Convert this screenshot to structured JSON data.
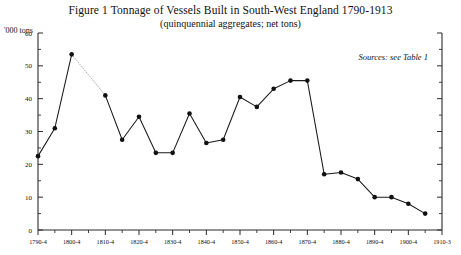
{
  "figure": {
    "title": "Figure 1   Tonnage of Vessels Built in South-West England 1790-1913",
    "subtitle": "(quinquennial aggregates; net tons)",
    "y_axis_unit": "'000 tons",
    "sources_note": "Sources: see Table 1"
  },
  "chart_data": {
    "type": "line",
    "title": "Figure 1   Tonnage of Vessels Built in South-West England 1790-1913",
    "subtitle": "(quinquennial aggregates; net tons)",
    "xlabel": "",
    "ylabel": "'000 tons",
    "ylim": [
      0,
      60
    ],
    "ytick_values": [
      0,
      10,
      20,
      30,
      40,
      50,
      60
    ],
    "ytick_labels": [
      "0",
      "10",
      "20",
      "30",
      "40",
      "50",
      "60"
    ],
    "yminor_step": 5,
    "grid": false,
    "legend": "none",
    "annotation": "Sources: see Table 1",
    "xtick_labels": [
      "1790-4",
      "1800-4",
      "1810-4",
      "1820-4",
      "1830-4",
      "1840-4",
      "1850-4",
      "1860-4",
      "1870-4",
      "1880-4",
      "1890-4",
      "1900-4",
      "1910-3"
    ],
    "categories": [
      "1790-4",
      "1795-9",
      "1800-4",
      "1805-9",
      "1810-4",
      "1815-9",
      "1820-4",
      "1825-9",
      "1830-4",
      "1835-9",
      "1840-4",
      "1845-9",
      "1850-4",
      "1855-9",
      "1860-4",
      "1865-9",
      "1870-4",
      "1875-9",
      "1880-4",
      "1885-9",
      "1890-4",
      "1895-9",
      "1900-4",
      "1905-9",
      "1910-3"
    ],
    "values": [
      22.5,
      31.0,
      53.5,
      null,
      41.0,
      27.5,
      34.5,
      23.5,
      23.5,
      35.5,
      26.5,
      27.5,
      40.5,
      37.5,
      43.0,
      45.5,
      45.5,
      17.0,
      17.5,
      15.5,
      10.0,
      10.0,
      8.0,
      5.0,
      null
    ],
    "dotted_segment": {
      "from": "1800-4",
      "to": "1810-4",
      "note": "interpolated across missing 1805-9 datum"
    },
    "marker": "filled-circle"
  }
}
